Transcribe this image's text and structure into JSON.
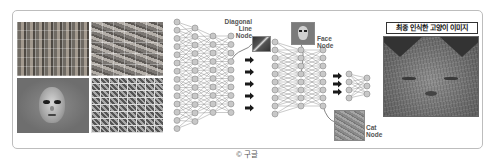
{
  "figure": {
    "labels": {
      "diagonal_line_node": "Diagonal\nLine\nNode",
      "face_node": "Face\nNode",
      "cat_node": "Cat\nNode"
    },
    "panels": {
      "collage": [
        "face-photos-grid",
        "cat-photos-grid",
        "average-face-image",
        "feature-patches-grid"
      ],
      "final_image_title": "최종 인식한 고양이 이미지"
    },
    "network": {
      "layer_groups": 3,
      "arrows_group1": 5,
      "arrows_group2": 3
    },
    "colors": {
      "node_fill": "#c8c8c8",
      "node_stroke": "#8a8a8a",
      "edge": "#7a7a7a",
      "arrow": "#1a1a1a",
      "frame_border": "#bdbdbd"
    }
  },
  "caption": "© 구글"
}
